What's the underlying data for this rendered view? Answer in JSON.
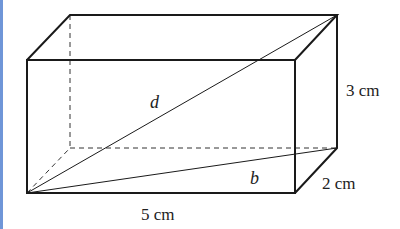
{
  "diagram": {
    "type": "rectangular-prism",
    "accent_bar_color": "#6f96d8",
    "line_color": "#1a1a1a",
    "labels": {
      "diagonal": "d",
      "base_diagonal": "b",
      "height": "3 cm",
      "length": "5 cm",
      "width": "2 cm"
    },
    "dimensions": {
      "length_cm": 5,
      "width_cm": 2,
      "height_cm": 3
    }
  }
}
